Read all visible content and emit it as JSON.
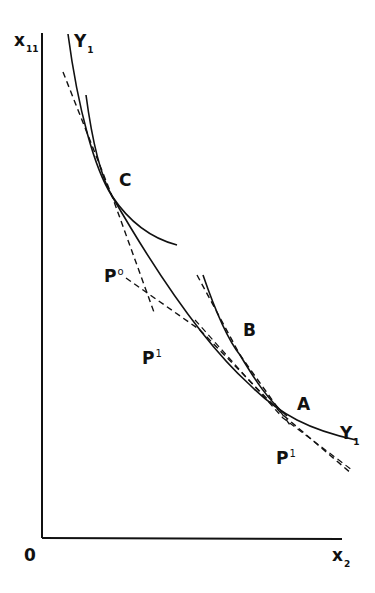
{
  "diagram": {
    "type": "isoquant-tangency",
    "axes": {
      "y_axis_label": {
        "base": "x",
        "sub": "11"
      },
      "x_axis_label": {
        "base": "x",
        "sub": "2"
      },
      "origin_label": "0"
    },
    "curves": [
      {
        "id": "Y1",
        "label": {
          "base": "Y",
          "sub": "1"
        },
        "style": "solid",
        "role": "isoquant"
      },
      {
        "id": "curve-through-C",
        "style": "solid"
      },
      {
        "id": "curve-through-B",
        "style": "solid"
      }
    ],
    "price_lines": [
      {
        "id": "P0",
        "label": {
          "base": "P",
          "sup": "o"
        },
        "style": "dashed"
      },
      {
        "id": "P1-left",
        "label": {
          "base": "P",
          "sup": "1"
        },
        "style": "dashed"
      },
      {
        "id": "P1-right",
        "label": {
          "base": "P",
          "sup": "1"
        },
        "style": "dashed"
      }
    ],
    "points": [
      {
        "label": "C"
      },
      {
        "label": "B"
      },
      {
        "label": "A"
      }
    ],
    "line_color": "#111111",
    "background": "#ffffff"
  }
}
